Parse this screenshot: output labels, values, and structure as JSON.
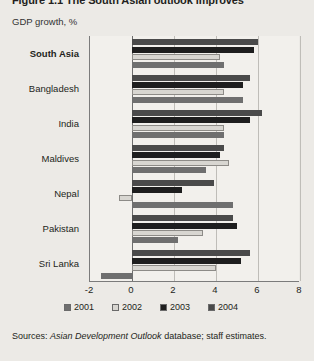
{
  "figure": {
    "title": "Figure 1.1 The South Asian outlook improves",
    "axis_title": "GDP growth, %",
    "sources_label": "Sources:",
    "sources_italic": "Asian Development Outlook",
    "sources_rest": "database; staff estimates."
  },
  "legend": {
    "position": "bottom",
    "items": [
      {
        "label": "2001",
        "color": "#6f6f6f"
      },
      {
        "label": "2002",
        "color": "#d8d6d1"
      },
      {
        "label": "2003",
        "color": "#1e1e1e"
      },
      {
        "label": "2004",
        "color": "#4a4a4a"
      }
    ]
  },
  "chart_data": {
    "type": "bar",
    "orientation": "horizontal",
    "title": "Figure 1.1 The South Asian outlook improves",
    "xlabel": "GDP growth, %",
    "ylabel": "",
    "xlim": [
      -2,
      8
    ],
    "xticks": [
      -2,
      0,
      2,
      4,
      6,
      8
    ],
    "grid": true,
    "categories": [
      "South Asia",
      "Bangladesh",
      "India",
      "Maldives",
      "Nepal",
      "Pakistan",
      "Sri Lanka"
    ],
    "bold_categories": [
      "South Asia"
    ],
    "series": [
      {
        "name": "2001",
        "color": "#6f6f6f",
        "values": [
          4.4,
          5.3,
          4.4,
          3.5,
          4.8,
          2.2,
          -1.5
        ]
      },
      {
        "name": "2002",
        "color": "#d8d6d1",
        "values": [
          4.2,
          4.4,
          4.4,
          4.6,
          -0.6,
          3.4,
          4.0
        ]
      },
      {
        "name": "2003",
        "color": "#1e1e1e",
        "values": [
          5.8,
          5.3,
          5.6,
          4.2,
          2.4,
          5.0,
          5.2
        ]
      },
      {
        "name": "2004",
        "color": "#4a4a4a",
        "values": [
          6.0,
          5.6,
          6.2,
          4.4,
          3.9,
          4.8,
          5.6
        ]
      }
    ],
    "series_order_top_to_bottom": [
      "2004",
      "2003",
      "2002",
      "2001"
    ]
  }
}
